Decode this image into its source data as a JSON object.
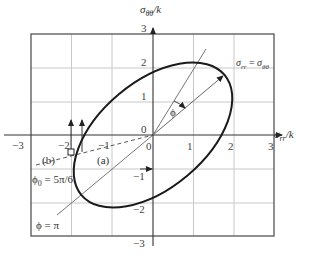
{
  "figure": {
    "axes": {
      "x_label": "σ",
      "x_label_sub": "rr",
      "x_label_suffix": "/k",
      "y_label": "σ",
      "y_label_sub": "θθ",
      "y_label_suffix": "/k",
      "x_ticks": [
        "−3",
        "−2",
        "−1",
        "0",
        "1",
        "2",
        "3"
      ],
      "y_ticks": [
        "3",
        "2",
        "1",
        "0",
        "−1",
        "−2",
        "−3"
      ],
      "xlim": [
        -3,
        3
      ],
      "ylim": [
        -3,
        3
      ],
      "grid": true
    },
    "curve": {
      "type": "ellipse",
      "equation": "x² − xy + y² = 3",
      "extreme_points": [
        [
          2,
          1
        ],
        [
          1,
          2
        ],
        [
          -1,
          -2
        ],
        [
          -2,
          -1
        ]
      ]
    },
    "annotations": {
      "diag_label": "σ",
      "diag_label_sub1": "rr",
      "diag_eq": " = ",
      "diag_label2": "σ",
      "diag_label_sub2": "θθ",
      "phi_label": "ϕ",
      "phi_pi_label": "ϕ = π",
      "phi0_label": "ϕ",
      "phi0_sub": "0",
      "phi0_value": " = 5π/6",
      "path_a": "(a)",
      "path_b": "(b)",
      "origin_label": "0"
    },
    "colors": {
      "curve": "#1a1a1a",
      "grid": "#c8c8c8",
      "frame": "#555555",
      "axes": "#333333",
      "thin_lines": "#666666"
    }
  }
}
